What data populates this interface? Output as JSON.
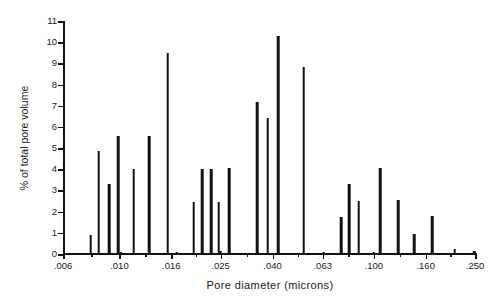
{
  "chart_data": {
    "type": "bar",
    "title": "",
    "xlabel": "Pore  diameter  (microns)",
    "ylabel": "% of total pore volume",
    "xscale": "log",
    "xlim": [
      0.006,
      0.25
    ],
    "ylim": [
      0,
      11
    ],
    "grid": false,
    "legend": null,
    "xticks": [
      ".006",
      ".010",
      ".016",
      ".025",
      ".040",
      ".063",
      ".100",
      ".160",
      ".250"
    ],
    "xtick_values": [
      0.006,
      0.01,
      0.016,
      0.025,
      0.04,
      0.063,
      0.1,
      0.16,
      0.25
    ],
    "yticks": [
      "0",
      "1",
      "2",
      "3",
      "4",
      "5",
      "6",
      "7",
      "8",
      "9",
      "10",
      "11"
    ],
    "ytick_values": [
      0,
      1,
      2,
      3,
      4,
      5,
      6,
      7,
      8,
      9,
      10,
      11
    ],
    "x": [
      0.0077,
      0.0083,
      0.0091,
      0.0099,
      0.0101,
      0.0114,
      0.0131,
      0.0155,
      0.0168,
      0.0196,
      0.0211,
      0.0229,
      0.0246,
      0.0249,
      0.027,
      0.0348,
      0.0383,
      0.042,
      0.053,
      0.0635,
      0.0745,
      0.08,
      0.0872,
      0.1,
      0.106,
      0.1245,
      0.144,
      0.17,
      0.208,
      0.248
    ],
    "values": [
      0.9,
      4.85,
      3.3,
      5.55,
      0.1,
      4.0,
      5.55,
      9.5,
      0.1,
      2.45,
      4.0,
      4.0,
      2.45,
      0.15,
      4.05,
      7.2,
      6.4,
      10.3,
      8.85,
      0.1,
      1.75,
      3.3,
      2.5,
      0.1,
      4.05,
      2.55,
      0.95,
      1.8,
      0.25,
      0.15
    ],
    "series_name": "% of total pore volume",
    "bar_color": "#111111",
    "background_color": "#ffffff"
  },
  "axes": {
    "x_title": "Pore  diameter  (microns)",
    "y_title": "% of total pore volume"
  }
}
